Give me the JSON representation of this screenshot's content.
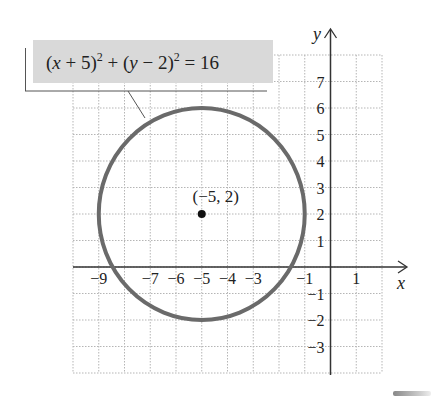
{
  "chart_data": {
    "type": "scatter",
    "title": "",
    "subtitle": "",
    "annotation": {
      "equation": "(x + 5)^2 + (y − 2)^2 = 16",
      "parts": [
        "(",
        "x",
        " + 5)",
        "2",
        " + (",
        "y",
        " − 2)",
        "2",
        " = 16"
      ]
    },
    "shapes": [
      {
        "kind": "circle",
        "center": [
          -5,
          2
        ],
        "radius": 4,
        "stroke": "#6a6a6a"
      }
    ],
    "points": [
      {
        "x": -5,
        "y": 2,
        "label": "(−5, 2)"
      }
    ],
    "xlabel": "x",
    "ylabel": "y",
    "xlim": [
      -10,
      2
    ],
    "ylim": [
      -4,
      8
    ],
    "grid": true,
    "grid_style": "dotted",
    "x_ticks": [
      {
        "value": -9,
        "label": "−9"
      },
      {
        "value": -7,
        "label": "−7"
      },
      {
        "value": -6,
        "label": "−6"
      },
      {
        "value": -5,
        "label": "−5"
      },
      {
        "value": -4,
        "label": "−4"
      },
      {
        "value": -3,
        "label": "−3"
      },
      {
        "value": -1,
        "label": "−1"
      },
      {
        "value": 1,
        "label": "1"
      }
    ],
    "y_ticks": [
      {
        "value": 7,
        "label": "7"
      },
      {
        "value": 6,
        "label": "6"
      },
      {
        "value": 5,
        "label": "5"
      },
      {
        "value": 4,
        "label": "4"
      },
      {
        "value": 3,
        "label": "3"
      },
      {
        "value": 2,
        "label": "2"
      },
      {
        "value": 1,
        "label": "1"
      },
      {
        "value": -1,
        "label": "−1"
      },
      {
        "value": -2,
        "label": "−2"
      },
      {
        "value": -3,
        "label": "−3"
      }
    ],
    "legend": null
  },
  "colors": {
    "circle": "#6a6a6a",
    "axis": "#333333",
    "grid": "#b5b5b5",
    "label_box": "#d9d9d9",
    "point": "#111111"
  }
}
